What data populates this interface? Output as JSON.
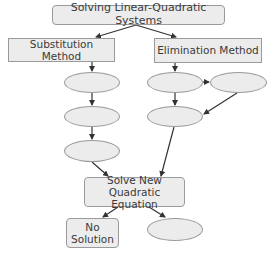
{
  "diagram": {
    "title": "Solving Linear-Quadratic Systems",
    "methods": {
      "substitution": "Substitution Method",
      "elimination": "Elimination Method"
    },
    "solve_node": "Solve New\nQuadratic Equation",
    "no_solution_node": "No\nSolution",
    "blank_nodes": [
      "substitution-step-1",
      "substitution-step-2",
      "substitution-step-3",
      "elimination-step-1",
      "elimination-step-2",
      "elimination-step-3",
      "solution-result"
    ],
    "colors": {
      "node_fill": "#ececec",
      "node_border": "#9a9a9a",
      "arrow": "#333333",
      "text": "#3a3a3a"
    }
  }
}
